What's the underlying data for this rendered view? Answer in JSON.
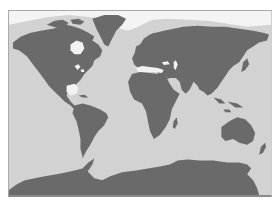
{
  "map": {
    "type": "world-map",
    "projection": "equirectangular",
    "labels": [],
    "colors": {
      "ocean": "#d2d2d2",
      "land": "#6a6a6a",
      "ice": "#f4f4f4",
      "inland_water": "#f2f2f2",
      "frame": "#a9a9a9"
    },
    "regions": [
      {
        "name": "North America"
      },
      {
        "name": "Greenland"
      },
      {
        "name": "South America"
      },
      {
        "name": "Europe"
      },
      {
        "name": "Africa"
      },
      {
        "name": "Asia"
      },
      {
        "name": "Australia"
      },
      {
        "name": "Antarctica"
      }
    ]
  }
}
